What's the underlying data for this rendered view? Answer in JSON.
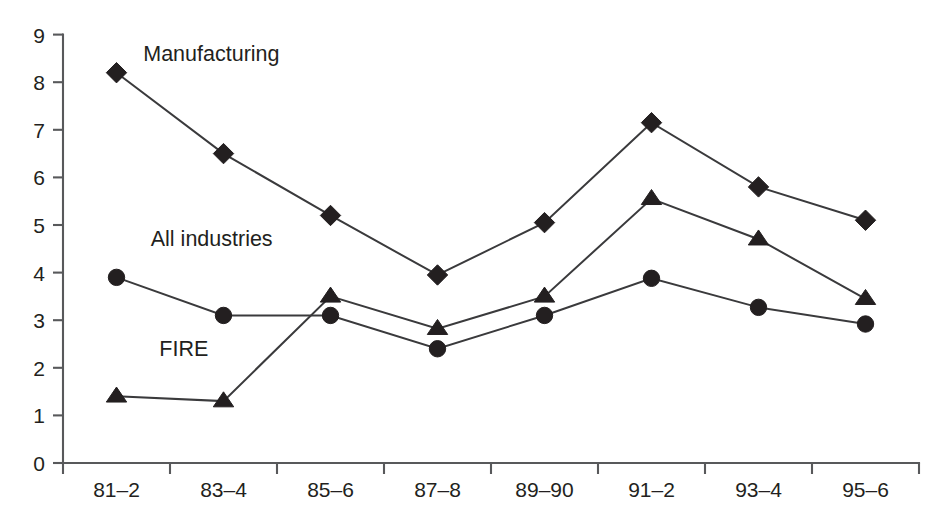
{
  "chart_data": {
    "type": "line",
    "title": "",
    "subtitle": "",
    "xlabel": "",
    "ylabel": "",
    "categories": [
      "81–2",
      "83–4",
      "85–6",
      "87–8",
      "89–90",
      "91–2",
      "93–4",
      "95–6"
    ],
    "ylim": [
      0,
      9
    ],
    "yticks": [
      "0",
      "1",
      "2",
      "3",
      "4",
      "5",
      "6",
      "7",
      "8",
      "9"
    ],
    "ytick_values": [
      0,
      1,
      2,
      3,
      4,
      5,
      6,
      7,
      8,
      9
    ],
    "grid": false,
    "legend": "inline-labels",
    "legend_position": "inline",
    "series": [
      {
        "name": "Manufacturing",
        "marker": "diamond",
        "color": "#231f20",
        "label_x_value": 0.25,
        "label_y_value": 8.45,
        "values": [
          8.2,
          6.5,
          5.2,
          3.95,
          5.05,
          7.15,
          5.8,
          5.1
        ]
      },
      {
        "name": "All industries",
        "marker": "circle",
        "color": "#231f20",
        "label_x_value": 0.32,
        "label_y_value": 4.55,
        "values": [
          3.9,
          3.1,
          3.1,
          2.4,
          3.1,
          3.88,
          3.27,
          2.92
        ]
      },
      {
        "name": "FIRE",
        "marker": "triangle",
        "color": "#231f20",
        "label_x_value": 0.4,
        "label_y_value": 2.25,
        "values": [
          1.4,
          1.3,
          3.5,
          2.82,
          3.5,
          5.55,
          4.7,
          3.45
        ]
      }
    ]
  },
  "axes": {
    "x_origin_px": 63,
    "x_step_px": 107,
    "y_zero_px": 463,
    "y_unit_px": 47.6
  }
}
